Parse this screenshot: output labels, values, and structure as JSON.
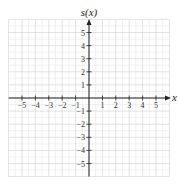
{
  "chart_data": {
    "type": "line",
    "title": "",
    "xlabel": "x",
    "ylabel": "s(x)",
    "xlim": [
      -6,
      6
    ],
    "ylim": [
      -6,
      6
    ],
    "grid": true,
    "minor_grid_step": 0.5,
    "x_ticks": [
      -5,
      -4,
      -3,
      -2,
      -1,
      1,
      2,
      3,
      4,
      5
    ],
    "y_ticks": [
      5,
      4,
      3,
      2,
      1,
      -1,
      -2,
      -3,
      -4,
      -5
    ],
    "x_tick_labels": [
      "−5",
      "−4",
      "−3",
      "−2",
      "−1",
      "1",
      "2",
      "3",
      "4",
      "5"
    ],
    "y_tick_labels": [
      "5",
      "4",
      "3",
      "2",
      "1",
      "−1",
      "−2",
      "−3",
      "−4",
      "−5"
    ],
    "series": []
  },
  "colors": {
    "axis": "#222222",
    "major_grid": "#cfcfcf",
    "minor_grid": "#e6e6e6"
  }
}
